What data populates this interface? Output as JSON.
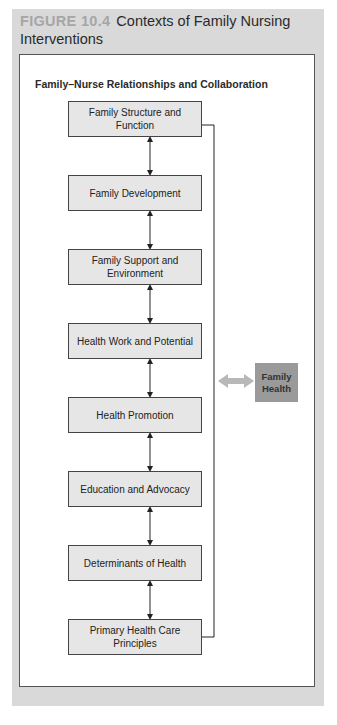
{
  "figure": {
    "label": "FIGURE 10.4",
    "title": "Contexts of Family Nursing Interventions"
  },
  "diagram": {
    "subtitle": "Family–Nurse Relationships and Collaboration",
    "boxes": [
      {
        "label": "Family Structure and Function"
      },
      {
        "label": "Family Development"
      },
      {
        "label": "Family Support and Environment"
      },
      {
        "label": "Health Work and Potential"
      },
      {
        "label": "Health Promotion"
      },
      {
        "label": "Education and Advocacy"
      },
      {
        "label": "Determinants of Health"
      },
      {
        "label": "Primary Health Care Principles"
      }
    ],
    "target": {
      "label": "Family Health"
    },
    "colors": {
      "outer_background": "#d9d9d9",
      "box_fill": "#e6e6e6",
      "target_fill": "#9a9a9a",
      "arrow_gray": "#b5b5b5"
    }
  }
}
